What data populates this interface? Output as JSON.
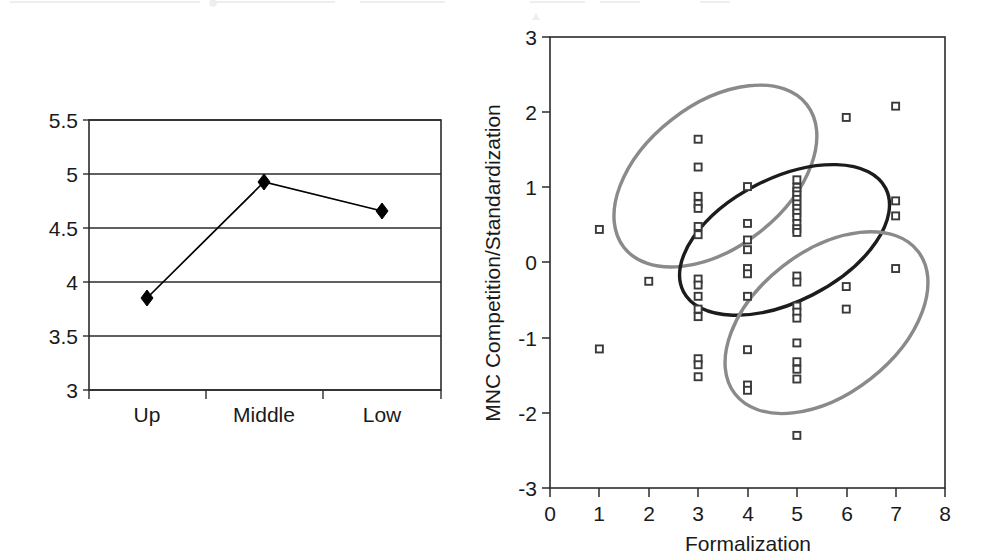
{
  "figure": {
    "background_color": "#ffffff",
    "panels": [
      "line-chart-left",
      "scatter-chart-right"
    ]
  },
  "chart_data": [
    {
      "id": "left-line-chart",
      "type": "line",
      "title": "",
      "subtitle": "",
      "xlabel": "",
      "ylabel": "",
      "categories": [
        "Up",
        "Middle",
        "Low"
      ],
      "values": [
        4.67,
        5.23,
        4.96
      ],
      "series": [
        {
          "name": "series-1",
          "values": [
            4.67,
            5.23,
            4.96
          ]
        }
      ],
      "ylim": [
        3,
        5.5
      ],
      "yticks": [
        3,
        3.5,
        4,
        4.5,
        5,
        5.5
      ],
      "ytick_labels": [
        "3",
        "3.5",
        "4",
        "4.5",
        "5",
        "5.5"
      ],
      "xtick_labels": [
        "Up",
        "Middle",
        "Low"
      ],
      "grid": "horizontal",
      "marker": "diamond",
      "marker_color": "#000000",
      "line_color": "#000000",
      "legend": "none"
    },
    {
      "id": "right-scatter-chart",
      "type": "scatter",
      "title": "",
      "xlabel": "Formalization",
      "ylabel": "MNC Competition/Standardization",
      "xlim": [
        0,
        8
      ],
      "ylim": [
        -3,
        3
      ],
      "xticks": [
        0,
        1,
        2,
        3,
        4,
        5,
        6,
        7,
        8
      ],
      "xtick_labels": [
        "0",
        "1",
        "2",
        "3",
        "4",
        "5",
        "6",
        "7",
        "8"
      ],
      "yticks": [
        -3,
        -2,
        -1,
        0,
        1,
        2,
        3
      ],
      "ytick_labels": [
        "-3",
        "-2",
        "-1",
        "0",
        "1",
        "2",
        "3"
      ],
      "grid": "off",
      "legend": "none",
      "marker": "open-square",
      "marker_color": "#3a3a3a",
      "points": [
        [
          1,
          0.44
        ],
        [
          1,
          -1.15
        ],
        [
          2,
          -0.25
        ],
        [
          3,
          1.64
        ],
        [
          3,
          1.27
        ],
        [
          3,
          0.88
        ],
        [
          3,
          0.78
        ],
        [
          3,
          0.72
        ],
        [
          3,
          0.48
        ],
        [
          3,
          0.37
        ],
        [
          3,
          -0.22
        ],
        [
          3,
          -0.3
        ],
        [
          3,
          -0.45
        ],
        [
          3,
          -0.62
        ],
        [
          3,
          -0.72
        ],
        [
          3,
          -1.28
        ],
        [
          3,
          -1.36
        ],
        [
          3,
          -1.52
        ],
        [
          4,
          1.01
        ],
        [
          4,
          0.52
        ],
        [
          4,
          0.3
        ],
        [
          4,
          0.17
        ],
        [
          4,
          -0.08
        ],
        [
          4,
          -0.15
        ],
        [
          4,
          -0.45
        ],
        [
          4,
          -1.16
        ],
        [
          4,
          -1.63
        ],
        [
          4,
          -1.7
        ],
        [
          5,
          1.1
        ],
        [
          5,
          1.0
        ],
        [
          5,
          0.95
        ],
        [
          5,
          0.9
        ],
        [
          5,
          0.84
        ],
        [
          5,
          0.78
        ],
        [
          5,
          0.72
        ],
        [
          5,
          0.66
        ],
        [
          5,
          0.6
        ],
        [
          5,
          0.52
        ],
        [
          5,
          0.45
        ],
        [
          5,
          0.4
        ],
        [
          5,
          -0.18
        ],
        [
          5,
          -0.26
        ],
        [
          5,
          -0.58
        ],
        [
          5,
          -0.66
        ],
        [
          5,
          -0.74
        ],
        [
          5,
          -1.07
        ],
        [
          5,
          -1.32
        ],
        [
          5,
          -1.42
        ],
        [
          5,
          -1.55
        ],
        [
          5,
          -2.3
        ],
        [
          6,
          1.93
        ],
        [
          6,
          -0.32
        ],
        [
          6,
          -0.62
        ],
        [
          7,
          2.08
        ],
        [
          7,
          0.82
        ],
        [
          7,
          0.62
        ],
        [
          7,
          -0.08
        ]
      ],
      "ellipses": [
        {
          "name": "upper-left-cluster-ellipse",
          "color": "#8a8a8a",
          "center": [
            3.35,
            1.15
          ],
          "rx": 2.35,
          "ry": 0.95,
          "rotation_deg": -38
        },
        {
          "name": "central-cluster-ellipse",
          "color": "#1c1c1c",
          "center": [
            4.75,
            0.3
          ],
          "rx": 2.3,
          "ry": 0.82,
          "rotation_deg": -27
        },
        {
          "name": "lower-right-cluster-ellipse",
          "color": "#8a8a8a",
          "center": [
            5.6,
            -0.8
          ],
          "rx": 2.35,
          "ry": 0.95,
          "rotation_deg": -38
        }
      ]
    }
  ]
}
